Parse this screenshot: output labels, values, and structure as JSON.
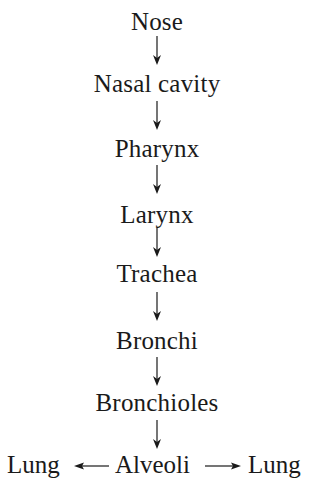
{
  "diagram": {
    "title": "",
    "type": "flowchart",
    "direction": "top-to-bottom",
    "colors": {
      "text": "#1a1a1a",
      "arrow": "#1a1a1a",
      "background": "#ffffff"
    },
    "nodes": [
      {
        "id": "nose",
        "label": "Nose"
      },
      {
        "id": "nasal_cavity",
        "label": "Nasal cavity"
      },
      {
        "id": "pharynx",
        "label": "Pharynx"
      },
      {
        "id": "larynx",
        "label": "Larynx"
      },
      {
        "id": "trachea",
        "label": "Trachea"
      },
      {
        "id": "bronchi",
        "label": "Bronchi"
      },
      {
        "id": "bronchioles",
        "label": "Bronchioles"
      }
    ],
    "bottom_row": {
      "left": {
        "id": "lung_left",
        "label": "Lung"
      },
      "center": {
        "id": "alveoli",
        "label": "Alveoli"
      },
      "right": {
        "id": "lung_right",
        "label": "Lung"
      }
    },
    "edges": [
      {
        "from": "Nose",
        "to": "Nasal cavity",
        "arrow": "down"
      },
      {
        "from": "Nasal cavity",
        "to": "Pharynx",
        "arrow": "down"
      },
      {
        "from": "Pharynx",
        "to": "Larynx",
        "arrow": "down"
      },
      {
        "from": "Larynx",
        "to": "Trachea",
        "arrow": "down"
      },
      {
        "from": "Trachea",
        "to": "Bronchi",
        "arrow": "down"
      },
      {
        "from": "Bronchi",
        "to": "Bronchioles",
        "arrow": "down"
      },
      {
        "from": "Bronchioles",
        "to": "Alveoli",
        "arrow": "down"
      },
      {
        "from": "Alveoli",
        "to": "Lung",
        "arrow": "left"
      },
      {
        "from": "Alveoli",
        "to": "Lung",
        "arrow": "right"
      }
    ]
  }
}
